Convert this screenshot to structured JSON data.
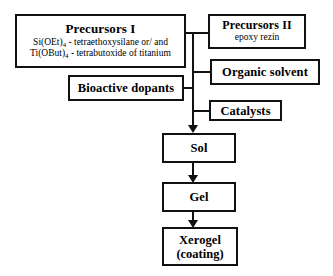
{
  "diagram": {
    "type": "flowchart",
    "colors": {
      "line": "#111111",
      "box_fill": "#ffffff",
      "background": "#ffffff",
      "text": "#000000"
    },
    "nodes": {
      "precursors_1": {
        "title": "Precursors I",
        "line_1_formula": "Si(OEt)",
        "line_1_sub": "4",
        "line_1_rest": " - tetraethoxysilane or/ and",
        "line_2_formula": "Ti(OBut)",
        "line_2_sub": "4",
        "line_2_rest": " - tetrabutoxide of titanium"
      },
      "precursors_2": {
        "title": "Precursors II",
        "subtitle": "epoxy rezin"
      },
      "organic_solvent": {
        "title": "Organic solvent"
      },
      "bioactive_dopants": {
        "title": "Bioactive dopants"
      },
      "catalysts": {
        "title": "Catalysts"
      },
      "sol": {
        "title": "Sol"
      },
      "gel": {
        "title": "Gel"
      },
      "xerogel": {
        "title": "Xerogel",
        "subtitle": "(coating)"
      }
    },
    "edges": [
      {
        "from": "precursors_1",
        "to": "trunk",
        "style": "line"
      },
      {
        "from": "trunk",
        "to": "precursors_2",
        "style": "line"
      },
      {
        "from": "trunk",
        "to": "organic_solvent",
        "style": "line"
      },
      {
        "from": "bioactive_dopants",
        "to": "trunk",
        "style": "line"
      },
      {
        "from": "trunk",
        "to": "catalysts",
        "style": "line"
      },
      {
        "from": "trunk",
        "to": "sol",
        "style": "arrow"
      },
      {
        "from": "sol",
        "to": "gel",
        "style": "arrow"
      },
      {
        "from": "gel",
        "to": "xerogel",
        "style": "arrow"
      }
    ]
  }
}
